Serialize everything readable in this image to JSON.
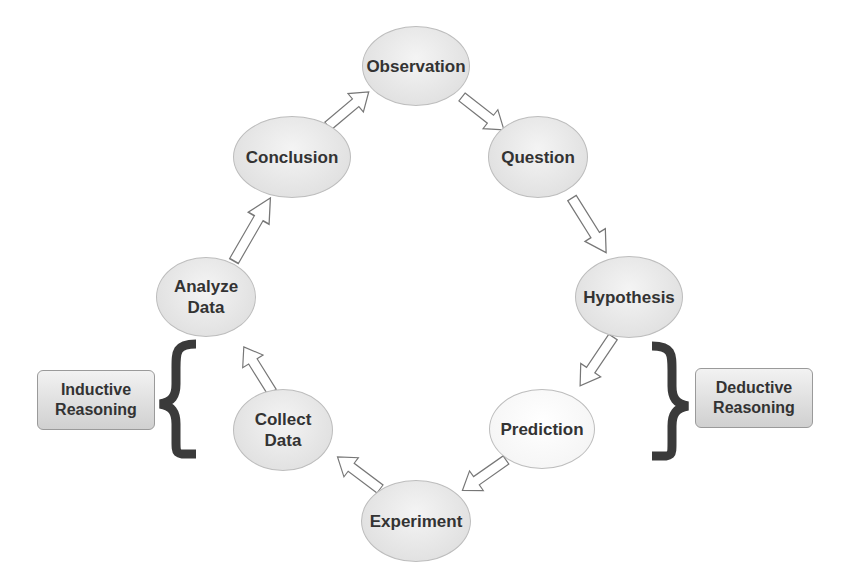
{
  "nodes": {
    "observation": "Observation",
    "question": "Question",
    "hypothesis": "Hypothesis",
    "prediction": "Prediction",
    "experiment": "Experiment",
    "collect_data": "Collect Data",
    "analyze_data": "Analyze Data",
    "conclusion": "Conclusion"
  },
  "labels": {
    "inductive": "Inductive Reasoning",
    "deductive": "Deductive Reasoning"
  },
  "colors": {
    "arrow_stroke": "#777777",
    "brace": "#3a3a3a",
    "text": "#333333"
  }
}
